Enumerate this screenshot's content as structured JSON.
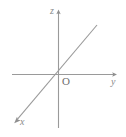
{
  "figure": {
    "kind": "coordinate-axes-diagram",
    "background_color": "#ffffff",
    "line_color": "#9a9a9a",
    "label_color": "#8a8a8a",
    "origin_label_color": "#6e6e6e",
    "width": 126,
    "height": 137
  },
  "axes": {
    "z": {
      "label": "z",
      "orientation": "vertical",
      "arrow": "up",
      "from": {
        "x": 58.5,
        "y": 128
      },
      "to": {
        "x": 58.5,
        "y": 11
      }
    },
    "y": {
      "label": "y",
      "orientation": "horizontal",
      "arrow": "right",
      "from": {
        "x": 12,
        "y": 74.5
      },
      "to": {
        "x": 117,
        "y": 74.5
      }
    },
    "x": {
      "label": "x",
      "orientation": "diagonal",
      "arrow": "down-left",
      "from": {
        "x": 97,
        "y": 25
      },
      "to": {
        "x": 15,
        "y": 122
      }
    }
  },
  "origin": {
    "label": "O",
    "position": {
      "x": 58.5,
      "y": 74.5
    }
  }
}
